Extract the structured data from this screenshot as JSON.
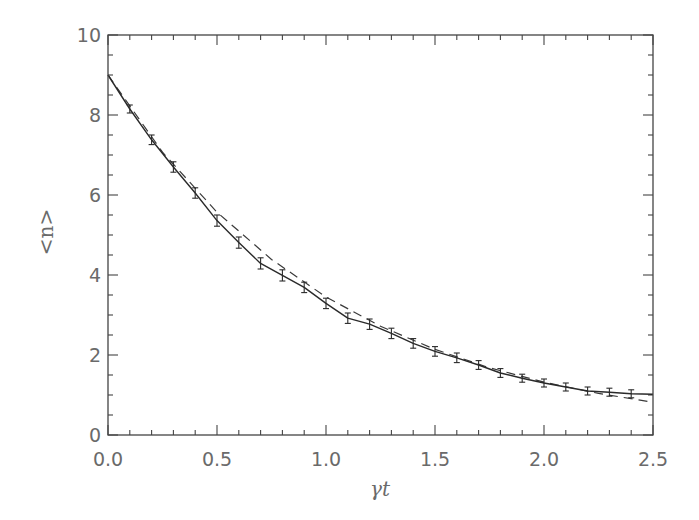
{
  "chart_data": {
    "type": "line",
    "title": "",
    "xlabel": "γt",
    "ylabel": "<n>",
    "xlim": [
      0.0,
      2.5
    ],
    "ylim": [
      0,
      10
    ],
    "grid": false,
    "legend": null,
    "x_ticks": [
      "0.0",
      "0.5",
      "1.0",
      "1.5",
      "2.0",
      "2.5"
    ],
    "x_tick_values": [
      0.0,
      0.5,
      1.0,
      1.5,
      2.0,
      2.5
    ],
    "x_minor_step": 0.1,
    "y_ticks": [
      "0",
      "2",
      "4",
      "6",
      "8",
      "10"
    ],
    "y_tick_values": [
      0,
      2,
      4,
      6,
      8,
      10
    ],
    "y_minor_step": 0.5,
    "series": [
      {
        "name": "simulation (with error bars)",
        "style": "solid",
        "x": [
          0.0,
          0.1,
          0.2,
          0.3,
          0.4,
          0.5,
          0.6,
          0.7,
          0.8,
          0.9,
          1.0,
          1.1,
          1.2,
          1.3,
          1.4,
          1.5,
          1.6,
          1.7,
          1.8,
          1.9,
          2.0,
          2.1,
          2.2,
          2.3,
          2.4,
          2.5
        ],
        "values": [
          9.0,
          8.15,
          7.38,
          6.7,
          6.05,
          5.36,
          4.81,
          4.29,
          3.99,
          3.69,
          3.29,
          2.92,
          2.77,
          2.54,
          2.29,
          2.09,
          1.93,
          1.75,
          1.55,
          1.42,
          1.3,
          1.2,
          1.1,
          1.07,
          1.03,
          1.02
        ],
        "error": [
          0.0,
          0.1,
          0.12,
          0.13,
          0.13,
          0.14,
          0.14,
          0.14,
          0.14,
          0.13,
          0.13,
          0.13,
          0.13,
          0.13,
          0.12,
          0.12,
          0.12,
          0.11,
          0.11,
          0.1,
          0.1,
          0.1,
          0.1,
          0.1,
          0.1,
          0.0
        ]
      },
      {
        "name": "exponential decay",
        "style": "dashed",
        "x": [
          0.0,
          0.25,
          0.5,
          0.75,
          1.0,
          1.25,
          1.5,
          1.75,
          2.0,
          2.25,
          2.5
        ],
        "values": [
          9.0,
          7.07,
          5.57,
          4.39,
          3.45,
          2.72,
          2.14,
          1.68,
          1.32,
          1.04,
          0.82
        ]
      }
    ]
  },
  "colors": {
    "axis": "#444444",
    "solid_line": "#2a2a2a",
    "dashed_line": "#3a3a3a",
    "text": "#6a6a6a"
  }
}
